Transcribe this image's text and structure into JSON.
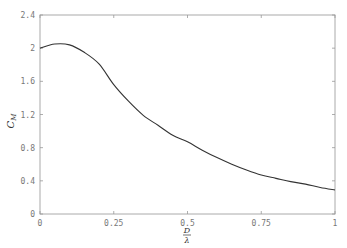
{
  "chart_data": {
    "type": "line",
    "title": "",
    "xlabel": "D/λ",
    "ylabel": "C_M",
    "xlim": [
      0,
      1
    ],
    "ylim": [
      0,
      2.4
    ],
    "grid": false,
    "legend": null,
    "x_ticks": [
      "0",
      "0.25",
      "0.5",
      "0.75",
      "1"
    ],
    "y_ticks": [
      "0",
      "0.4",
      "0.8",
      "1.2",
      "1.6",
      "2",
      "2.4"
    ],
    "series": [
      {
        "name": "C_M",
        "color": "#333333",
        "x": [
          0,
          0.05,
          0.1,
          0.15,
          0.2,
          0.25,
          0.3,
          0.35,
          0.4,
          0.45,
          0.5,
          0.55,
          0.6,
          0.65,
          0.7,
          0.75,
          0.8,
          0.85,
          0.9,
          0.95,
          1.0
        ],
        "y": [
          2.0,
          2.05,
          2.04,
          1.95,
          1.81,
          1.56,
          1.36,
          1.19,
          1.07,
          0.95,
          0.87,
          0.77,
          0.68,
          0.6,
          0.53,
          0.47,
          0.43,
          0.39,
          0.36,
          0.32,
          0.29
        ]
      }
    ]
  }
}
